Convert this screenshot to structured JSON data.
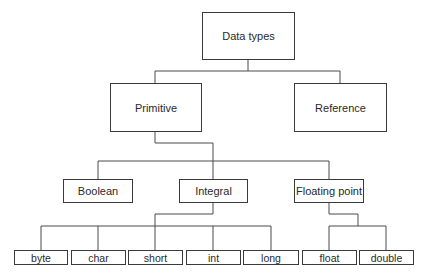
{
  "diagram": {
    "title": "Data types",
    "root": {
      "id": "data-types",
      "label": "Data types"
    },
    "level1": [
      {
        "id": "primitive",
        "label": "Primitive"
      },
      {
        "id": "reference",
        "label": "Reference"
      }
    ],
    "level2": [
      {
        "id": "boolean",
        "label": "Boolean",
        "parent": "primitive"
      },
      {
        "id": "integral",
        "label": "Integral",
        "parent": "primitive"
      },
      {
        "id": "floating-point",
        "label": "Floating point",
        "parent": "primitive"
      }
    ],
    "level3": [
      {
        "id": "byte",
        "label": "byte",
        "parent": "integral"
      },
      {
        "id": "char",
        "label": "char",
        "parent": "integral"
      },
      {
        "id": "short",
        "label": "short",
        "parent": "integral"
      },
      {
        "id": "int",
        "label": "int",
        "parent": "integral"
      },
      {
        "id": "long",
        "label": "long",
        "parent": "integral"
      },
      {
        "id": "float",
        "label": "float",
        "parent": "floating-point"
      },
      {
        "id": "double",
        "label": "double",
        "parent": "floating-point"
      }
    ],
    "colors": {
      "line": "#4a4a4a",
      "border": "#3a3a3a",
      "text": "#2a2a2a",
      "background": "#ffffff"
    }
  }
}
